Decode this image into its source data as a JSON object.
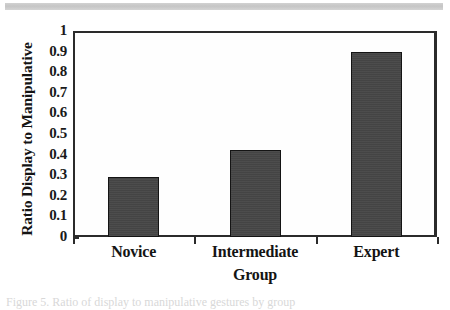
{
  "figure": {
    "scan_artifact": "gray-scan-bar",
    "caption_partial": "Figure 5.  Ratio of display to manipulative gestures by group"
  },
  "chart_data": {
    "type": "bar",
    "title": "",
    "categories": [
      "Novice",
      "Intermediate",
      "Expert"
    ],
    "values": [
      0.29,
      0.42,
      0.9
    ],
    "xlabel": "Group",
    "ylabel": "Ratio Display to Manipulative",
    "ylim": [
      0,
      1
    ],
    "ytick_labels": [
      "1",
      "0.9",
      "0.8",
      "0.7",
      "0.6",
      "0.5",
      "0.4",
      "0.3",
      "0.2",
      "0.1",
      "0"
    ],
    "ytick_values": [
      1,
      0.9,
      0.8,
      0.7,
      0.6,
      0.5,
      0.4,
      0.3,
      0.2,
      0.1,
      0
    ],
    "grid": false,
    "legend": "none",
    "bar_color": "#464646",
    "axis_color": "#2b2b2b",
    "text_color": "#141414"
  }
}
